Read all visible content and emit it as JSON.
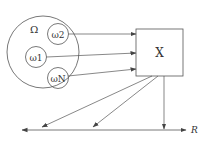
{
  "diagram": {
    "sample_space": {
      "label": "Ω"
    },
    "outcomes": [
      {
        "label": "ω2"
      },
      {
        "label": "ω1"
      },
      {
        "label": "ωN"
      }
    ],
    "mapping_box": {
      "label": "X"
    },
    "real_line": {
      "label": "R"
    },
    "colors": {
      "stroke": "#555555",
      "text": "#333333",
      "background": "#ffffff"
    }
  }
}
